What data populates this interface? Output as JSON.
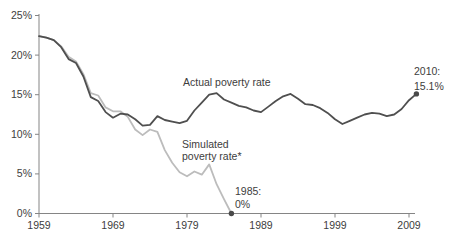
{
  "colors": {
    "background": "#ffffff",
    "text": "#3d3d3d",
    "axis": "#858585",
    "actual_line": "#4f4f4f",
    "simulated_line": "#bcbcbc",
    "endpoint_dot": "#4a4a4a"
  },
  "labels": {
    "simulated_line1": "Simulated",
    "simulated_line2": "poverty rate*"
  },
  "axis": {
    "y_tick_labels": [
      "0%",
      "5%",
      "10%",
      "15%",
      "20%",
      "25%"
    ],
    "x_tick_labels": [
      "1959",
      "1969",
      "1979",
      "1989",
      "1999",
      "2009"
    ]
  },
  "chart_data": {
    "type": "line",
    "title": "",
    "xlabel": "",
    "ylabel": "",
    "grid": false,
    "x_start_year": 1959,
    "xlim": [
      1959,
      2010
    ],
    "ylim": [
      0,
      25
    ],
    "series": [
      {
        "name": "Actual poverty rate",
        "color": "#4f4f4f",
        "start_year": 1959,
        "values": [
          22.4,
          22.2,
          21.9,
          21.0,
          19.5,
          19.0,
          17.3,
          14.7,
          14.2,
          12.8,
          12.1,
          12.6,
          12.5,
          11.9,
          11.1,
          11.2,
          12.3,
          11.8,
          11.6,
          11.4,
          11.7,
          13.0,
          14.0,
          15.0,
          15.2,
          14.4,
          14.0,
          13.6,
          13.4,
          13.0,
          12.8,
          13.5,
          14.2,
          14.8,
          15.1,
          14.5,
          13.8,
          13.7,
          13.3,
          12.7,
          11.9,
          11.3,
          11.7,
          12.1,
          12.5,
          12.7,
          12.6,
          12.3,
          12.5,
          13.2,
          14.3,
          15.1
        ]
      },
      {
        "name": "Simulated poverty rate*",
        "color": "#bcbcbc",
        "start_year": 1959,
        "values": [
          22.4,
          22.2,
          21.9,
          21.1,
          19.8,
          19.2,
          17.6,
          15.2,
          14.9,
          13.4,
          12.9,
          12.9,
          12.2,
          10.6,
          9.9,
          10.6,
          10.3,
          8.0,
          6.4,
          5.2,
          4.7,
          5.3,
          4.9,
          6.2,
          3.7,
          1.8,
          0.0
        ]
      }
    ],
    "endpoint_markers": [
      {
        "series": "Simulated poverty rate*",
        "year": 1985,
        "value": 0,
        "label_lines": [
          "1985:",
          "0%"
        ]
      },
      {
        "series": "Actual poverty rate",
        "year": 2010,
        "value": 15.1,
        "label_lines": [
          "2010:",
          "15.1%"
        ]
      }
    ]
  }
}
